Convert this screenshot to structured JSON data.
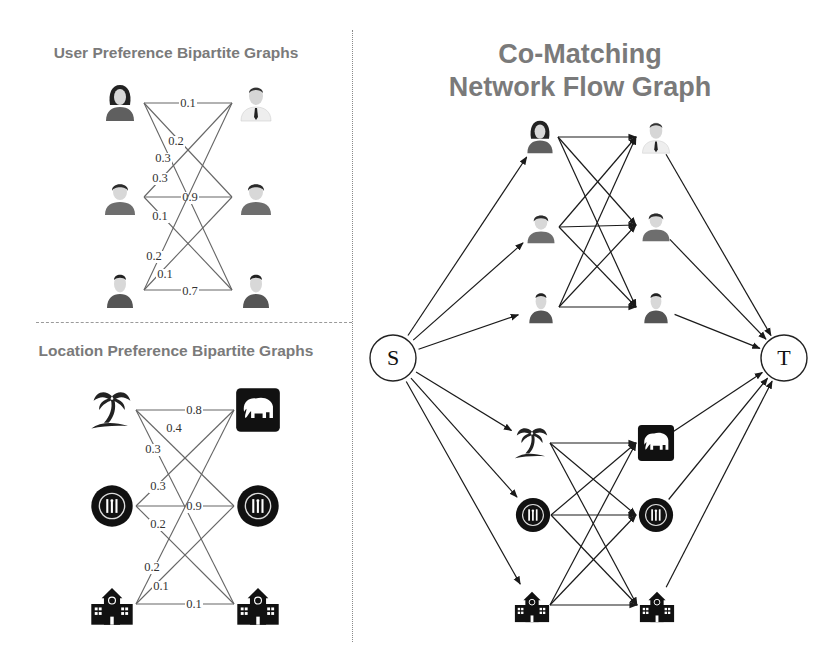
{
  "titles": {
    "user_graph": "User Preference Bipartite Graphs",
    "location_graph": "Location Preference Bipartite Graphs",
    "network_line1": "Co-Matching",
    "network_line2": "Network Flow Graph"
  },
  "colors": {
    "title": "#7a7a7a",
    "edge_left": "#666666",
    "edge_right": "#1a1a1a",
    "icon_dark": "#111111",
    "person_shirt": "#6e6e6e",
    "person_skin": "#d8d8d8"
  },
  "user_graph": {
    "left_nodes": [
      "woman-icon",
      "boy-icon",
      "man-icon"
    ],
    "right_nodes": [
      "businessman-icon",
      "boy-icon",
      "man-icon"
    ],
    "edges": [
      {
        "from": 0,
        "to": 0,
        "weight": "0.1"
      },
      {
        "from": 0,
        "to": 1,
        "weight": "0.2"
      },
      {
        "from": 0,
        "to": 2,
        "weight": "0.3"
      },
      {
        "from": 1,
        "to": 0,
        "weight": "0.3"
      },
      {
        "from": 1,
        "to": 1,
        "weight": "0.9"
      },
      {
        "from": 1,
        "to": 2,
        "weight": "0.1"
      },
      {
        "from": 2,
        "to": 0,
        "weight": "0.2"
      },
      {
        "from": 2,
        "to": 1,
        "weight": "0.1"
      },
      {
        "from": 2,
        "to": 2,
        "weight": "0.7"
      }
    ]
  },
  "location_graph": {
    "left_nodes": [
      "palm-tree-icon",
      "restaurant-icon",
      "school-icon"
    ],
    "right_nodes": [
      "elephant-zoo-icon",
      "restaurant-icon",
      "school-icon"
    ],
    "edges": [
      {
        "from": 0,
        "to": 0,
        "weight": "0.8"
      },
      {
        "from": 0,
        "to": 1,
        "weight": "0.4"
      },
      {
        "from": 0,
        "to": 2,
        "weight": "0.3"
      },
      {
        "from": 1,
        "to": 0,
        "weight": "0.3"
      },
      {
        "from": 1,
        "to": 1,
        "weight": "0.9"
      },
      {
        "from": 1,
        "to": 2,
        "weight": "0.2"
      },
      {
        "from": 2,
        "to": 0,
        "weight": "0.2"
      },
      {
        "from": 2,
        "to": 1,
        "weight": "0.1"
      },
      {
        "from": 2,
        "to": 2,
        "weight": "0.1"
      }
    ]
  },
  "network": {
    "source_label": "S",
    "sink_label": "T",
    "user_left": [
      "woman-icon",
      "boy-icon",
      "man-icon"
    ],
    "user_right": [
      "businessman-icon",
      "boy-icon",
      "man-icon"
    ],
    "location_left": [
      "palm-tree-icon",
      "restaurant-icon",
      "school-icon"
    ],
    "location_right": [
      "elephant-zoo-icon",
      "restaurant-icon",
      "school-icon"
    ]
  }
}
